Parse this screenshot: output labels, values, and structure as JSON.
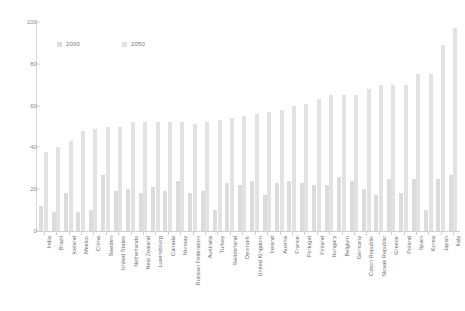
{
  "chart_data": {
    "type": "bar",
    "title": "",
    "subtitle": "",
    "xlabel": "",
    "ylabel": "",
    "ylim": [
      0,
      100
    ],
    "yticks": [
      0,
      20,
      40,
      60,
      80,
      100
    ],
    "grid": false,
    "legend_position": "top-left",
    "orientation": "vertical",
    "categories": [
      "India",
      "Brazil",
      "Iceland",
      "Mexico",
      "China",
      "Sweden",
      "United States",
      "Netherlands",
      "New Zealand",
      "Luxembourg",
      "Canada",
      "Norway",
      "Russian Federation",
      "Australia",
      "Turkey",
      "Switzerland",
      "Denmark",
      "United Kingdom",
      "Ireland",
      "Austria",
      "France",
      "Portugal",
      "Finland",
      "Hungary",
      "Belgium",
      "Germany",
      "Czech Republic",
      "Slovak Republic",
      "Greece",
      "Poland",
      "Spain",
      "Korea",
      "Japan",
      "Italy"
    ],
    "series": [
      {
        "name": "2000",
        "color": "#dcdcdc",
        "values": [
          12,
          9,
          18,
          9,
          10,
          27,
          19,
          20,
          18,
          21,
          19,
          24,
          18,
          19,
          10,
          23,
          22,
          24,
          17,
          23,
          24,
          23,
          22,
          22,
          26,
          24,
          20,
          17,
          25,
          18,
          25,
          10,
          25,
          27
        ]
      },
      {
        "name": "2050",
        "color": "#e2e2e2",
        "values": [
          38,
          40,
          43,
          48,
          49,
          50,
          50,
          52,
          52,
          52,
          52,
          52,
          51,
          52,
          53,
          54,
          55,
          56,
          57,
          58,
          60,
          61,
          63,
          65,
          65,
          65,
          68,
          70,
          70,
          70,
          75,
          75,
          89,
          97
        ]
      }
    ]
  },
  "legend": {
    "items": [
      {
        "label": "2000",
        "color": "#dcdcdc"
      },
      {
        "label": "2050",
        "color": "#e2e2e2"
      }
    ]
  }
}
